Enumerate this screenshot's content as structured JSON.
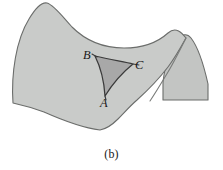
{
  "figure": {
    "caption": "(b)",
    "kind": "saddle-surface-geodesic-triangle",
    "background_color": "#ffffff"
  },
  "surface": {
    "name": "hyperbolic saddle surface",
    "fill_color": "#c9cbc9",
    "right_lobe_fill_color": "#c3c5c3",
    "outline_color": "#6b6d6b",
    "fold_line_color": "#7a7c7a"
  },
  "triangle": {
    "name": "geodesic triangle ABC",
    "fill_color": "#a8a8a8",
    "edge_color": "#3a3a3a",
    "edge_curvature": "concave",
    "vertices": [
      {
        "label": "A",
        "x": 105,
        "y": 96
      },
      {
        "label": "B",
        "x": 95,
        "y": 56
      },
      {
        "label": "C",
        "x": 133,
        "y": 64
      }
    ],
    "labels": {
      "a": "A",
      "b": "B",
      "c": "C"
    }
  }
}
